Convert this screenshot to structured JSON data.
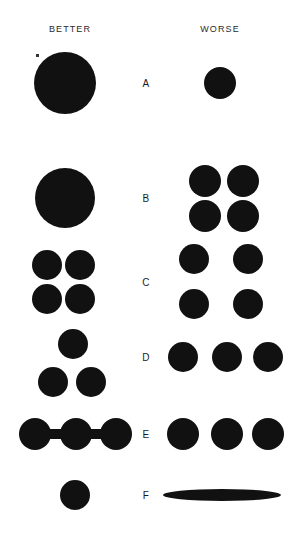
{
  "figure": {
    "width": 292,
    "height": 535,
    "background_color": "#ffffff",
    "ink_color": "#111111",
    "title": "",
    "columns": [
      {
        "key": "better",
        "label": "BETTER"
      },
      {
        "key": "worse",
        "label": "WORSE"
      }
    ],
    "row_labels": [
      "A",
      "B",
      "C",
      "D",
      "E",
      "F"
    ]
  },
  "rows": [
    {
      "id": "A",
      "label": "A",
      "better_description": "one large solid circle",
      "worse_description": "one small solid circle",
      "better_shapes": [
        {
          "type": "circle",
          "cx": 65,
          "cy": 83,
          "r": 31
        }
      ],
      "worse_shapes": [
        {
          "type": "circle",
          "cx": 220,
          "cy": 83,
          "r": 16
        }
      ]
    },
    {
      "id": "B",
      "label": "B",
      "better_description": "one large solid circle",
      "worse_description": "four medium circles in a tight two-by-two grid",
      "better_shapes": [
        {
          "type": "circle",
          "cx": 65,
          "cy": 198,
          "r": 30
        }
      ],
      "worse_shapes": [
        {
          "type": "circle",
          "cx": 205,
          "cy": 181,
          "r": 16
        },
        {
          "type": "circle",
          "cx": 243,
          "cy": 181,
          "r": 16
        },
        {
          "type": "circle",
          "cx": 205,
          "cy": 216,
          "r": 16
        },
        {
          "type": "circle",
          "cx": 243,
          "cy": 216,
          "r": 16
        }
      ]
    },
    {
      "id": "C",
      "label": "C",
      "better_description": "four circles in a tight two-by-two grid",
      "worse_description": "four circles in a widely spaced two-by-two grid",
      "better_shapes": [
        {
          "type": "circle",
          "cx": 47,
          "cy": 265,
          "r": 15
        },
        {
          "type": "circle",
          "cx": 80,
          "cy": 265,
          "r": 15
        },
        {
          "type": "circle",
          "cx": 47,
          "cy": 299,
          "r": 15
        },
        {
          "type": "circle",
          "cx": 80,
          "cy": 299,
          "r": 15
        }
      ],
      "worse_shapes": [
        {
          "type": "circle",
          "cx": 194,
          "cy": 259,
          "r": 15
        },
        {
          "type": "circle",
          "cx": 248,
          "cy": 259,
          "r": 15
        },
        {
          "type": "circle",
          "cx": 194,
          "cy": 304,
          "r": 15
        },
        {
          "type": "circle",
          "cx": 248,
          "cy": 304,
          "r": 15
        }
      ]
    },
    {
      "id": "D",
      "label": "D",
      "better_description": "three circles in a triangular cluster",
      "worse_description": "three circles in a straight horizontal row",
      "better_shapes": [
        {
          "type": "circle",
          "cx": 73,
          "cy": 344,
          "r": 15
        },
        {
          "type": "circle",
          "cx": 53,
          "cy": 382,
          "r": 15
        },
        {
          "type": "circle",
          "cx": 91,
          "cy": 382,
          "r": 15
        }
      ],
      "worse_shapes": [
        {
          "type": "circle",
          "cx": 183,
          "cy": 357,
          "r": 15
        },
        {
          "type": "circle",
          "cx": 227,
          "cy": 357,
          "r": 15
        },
        {
          "type": "circle",
          "cx": 268,
          "cy": 357,
          "r": 15
        }
      ]
    },
    {
      "id": "E",
      "label": "E",
      "better_description": "three circles joined by thick horizontal connecting bars",
      "worse_description": "three separate unconnected circles in a row",
      "better_shapes": [
        {
          "type": "circle",
          "cx": 35,
          "cy": 434,
          "r": 16
        },
        {
          "type": "circle",
          "cx": 76,
          "cy": 434,
          "r": 16
        },
        {
          "type": "circle",
          "cx": 116,
          "cy": 434,
          "r": 16
        },
        {
          "type": "bar",
          "x": 35,
          "y": 429,
          "w": 82,
          "h": 10
        }
      ],
      "worse_shapes": [
        {
          "type": "circle",
          "cx": 183,
          "cy": 434,
          "r": 16
        },
        {
          "type": "circle",
          "cx": 227,
          "cy": 434,
          "r": 16
        },
        {
          "type": "circle",
          "cx": 268,
          "cy": 434,
          "r": 16
        }
      ]
    },
    {
      "id": "F",
      "label": "F",
      "better_description": "one small circle of normal aspect ratio",
      "worse_description": "one extremely flattened elongated lens-shaped ellipse",
      "better_shapes": [
        {
          "type": "circle",
          "cx": 75,
          "cy": 495,
          "r": 15
        }
      ],
      "worse_shapes": [
        {
          "type": "ellipse",
          "cx": 222,
          "cy": 495,
          "rx": 59,
          "ry": 6
        }
      ]
    }
  ],
  "artifacts": [
    {
      "x": 36,
      "y": 54,
      "w": 3,
      "h": 3
    }
  ]
}
